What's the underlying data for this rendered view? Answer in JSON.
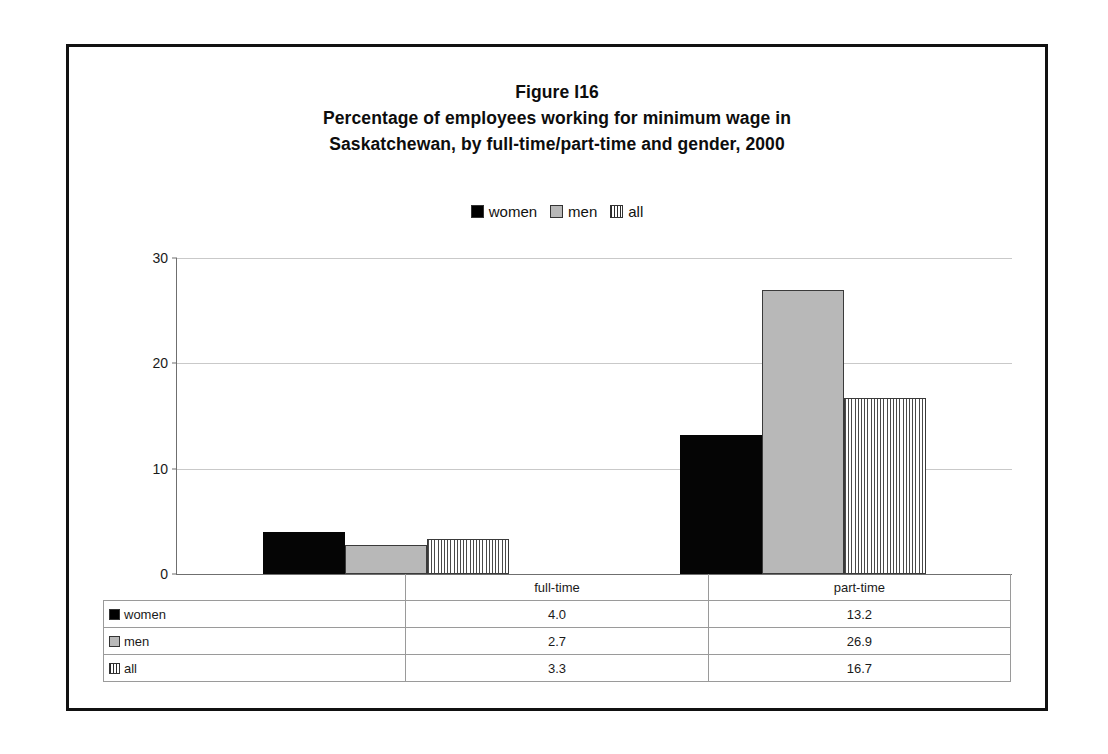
{
  "figure": {
    "title_lines": [
      "Figure I16",
      "Percentage of employees working for minimum wage in",
      "Saskatchewan, by full-time/part-time and gender, 2000"
    ]
  },
  "legend": {
    "items": [
      {
        "label": "women",
        "marker": "black-square-icon",
        "color": "#050505"
      },
      {
        "label": "men",
        "marker": "gray-square-icon",
        "color": "#b8b8b8"
      },
      {
        "label": "all",
        "marker": "striped-square-icon",
        "color": "#4a4a4a"
      }
    ]
  },
  "axis": {
    "y_ticks": [
      "0",
      "10",
      "20",
      "30"
    ]
  },
  "table": {
    "corner_label": "",
    "column_headers": [
      "full-time",
      "part-time"
    ],
    "rows": [
      {
        "label": "women",
        "marker": "black-square-icon",
        "values": [
          "4.0",
          "13.2"
        ]
      },
      {
        "label": "men",
        "marker": "gray-square-icon",
        "values": [
          "2.7",
          "26.9"
        ]
      },
      {
        "label": "all",
        "marker": "striped-square-icon",
        "values": [
          "3.3",
          "16.7"
        ]
      }
    ]
  },
  "chart_data": {
    "type": "bar",
    "xlabel": "",
    "ylabel": "",
    "categories": [
      "full-time",
      "part-time"
    ],
    "series": [
      {
        "name": "women",
        "values": [
          4.0,
          13.2
        ],
        "fill": "solid-black",
        "color": "#050505"
      },
      {
        "name": "men",
        "values": [
          2.7,
          26.9
        ],
        "fill": "solid-gray",
        "color": "#b8b8b8"
      },
      {
        "name": "all",
        "values": [
          3.3,
          16.7
        ],
        "fill": "vertical-stripes",
        "color": "#4a4a4a"
      }
    ],
    "ylim": [
      0,
      30
    ],
    "yticks": [
      0,
      10,
      20,
      30
    ],
    "grid": "horizontal",
    "legend_position": "top-center"
  }
}
